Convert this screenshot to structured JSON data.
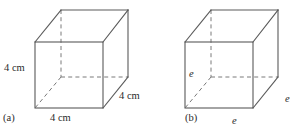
{
  "figure": {
    "caption_a": "(a)",
    "caption_b": "(b)",
    "cube_a": {
      "part": "(a)",
      "edge_label_height": "4 cm",
      "edge_label_width": "4 cm",
      "edge_label_depth": "4 cm"
    },
    "cube_b": {
      "part": "(b)",
      "edge_label_height": "e",
      "edge_label_width": "e",
      "edge_label_depth": "e"
    },
    "colors": {
      "background": "#ffffff",
      "edge_visible": "#5a5a5a",
      "edge_hidden": "#7a7a7a",
      "text": "#2b2b2b"
    }
  }
}
